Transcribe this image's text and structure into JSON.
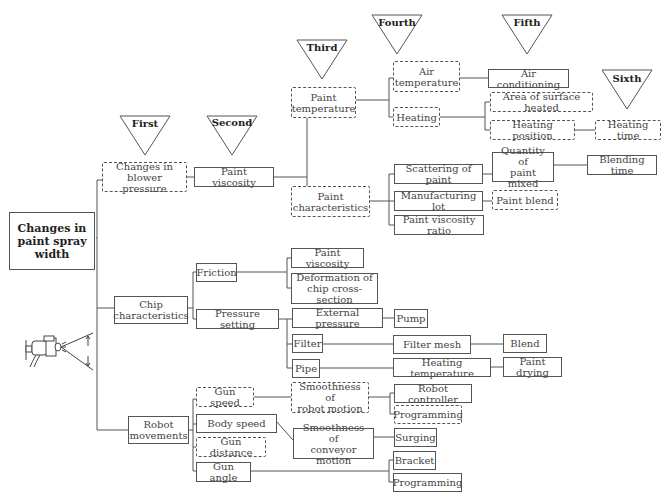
{
  "stages": [
    "First",
    "Second",
    "Third",
    "Fourth",
    "Fifth",
    "Sixth"
  ],
  "root": "Changes in\npaint spray\nwidth",
  "nodes": {
    "blower": "Changes in\nblower pressure",
    "viscosity1": "Paint viscosity",
    "paint_temp": "Paint\ntemperature",
    "paint_char": "Paint\ncharacteristics",
    "air_temp": "Air\ntemperature",
    "heating": "Heating",
    "air_cond": "Air conditioning",
    "area_heated": "Area of surface heated",
    "heating_pos": "Heating position",
    "heating_time": "Heating time",
    "scattering": "Scattering of paint",
    "manuf_lot": "Manufacturing lot",
    "visc_ratio": "Paint viscosity ratio",
    "qty_mixed": "Quantity of\npaint mixed",
    "blending_time": "Blending time",
    "paint_blend": "Paint blend",
    "chip": "Chip\ncharacteristics",
    "friction": "Friction",
    "pressure_setting": "Pressure setting",
    "viscosity2": "Paint viscosity",
    "deformation": "Deformation of\nchip cross-section",
    "ext_pressure": "External pressure",
    "pump": "Pump",
    "filter": "Filter",
    "filter_mesh": "Filter mesh",
    "blend": "Blend",
    "pipe": "Pipe",
    "heating_temp": "Heating temperature",
    "paint_drying": "Paint drying",
    "robot": "Robot\nmovements",
    "gun_speed": "Gun speed",
    "body_speed": "Body speed",
    "gun_distance": "Gun distance",
    "gun_angle": "Gun angle",
    "smooth_robot": "Smoothness of\nrobot motion",
    "smooth_conveyor": "Smoothness of\nconveyor motion",
    "robot_controller": "Robot controller",
    "programming1": "Programming",
    "surging": "Surging",
    "bracket": "Bracket",
    "programming2": "Programming"
  },
  "illustration": "spray-gun-icon"
}
